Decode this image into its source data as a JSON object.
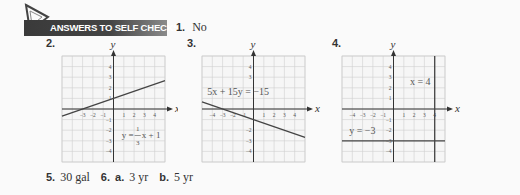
{
  "header": {
    "banner_title": "ANSWERS TO SELF CHECKS",
    "item1_number": "1.",
    "item1_answer": "No"
  },
  "labels": {
    "item2": "2.",
    "item3": "3.",
    "item4": "4."
  },
  "bottom": {
    "item5_number": "5.",
    "item5_answer": "30 gal",
    "item6_number": "6.",
    "item6a_label": "a.",
    "item6a_answer": "3 yr",
    "item6b_label": "b.",
    "item6b_answer": "5 yr"
  },
  "chart_data": [
    {
      "type": "line",
      "title": "2.",
      "xlabel": "x",
      "ylabel": "y",
      "xlim": [
        -5,
        5
      ],
      "ylim": [
        -5,
        5
      ],
      "xticks": [
        "-3",
        "-2",
        "-1",
        "1",
        "2",
        "3",
        "4"
      ],
      "yticks": [
        "4",
        "3",
        "2",
        "1",
        "-1",
        "-2",
        "-3",
        "-4"
      ],
      "grid": true,
      "series": [
        {
          "name": "y = 1/3 x + 1",
          "x": [
            -5,
            5
          ],
          "y": [
            -0.667,
            2.667
          ]
        }
      ],
      "annotation": {
        "text_main": "y =",
        "frac_num": "1",
        "frac_den": "3",
        "text_tail": "x + 1"
      }
    },
    {
      "type": "line",
      "title": "3.",
      "xlabel": "x",
      "ylabel": "y",
      "xlim": [
        -5,
        5
      ],
      "ylim": [
        -5,
        5
      ],
      "xticks": [
        "-4",
        "-3",
        "-2",
        "-1",
        "1",
        "2",
        "3",
        "4"
      ],
      "yticks": [
        "4",
        "3",
        "-2",
        "-3",
        "-4"
      ],
      "grid": true,
      "series": [
        {
          "name": "5x + 15y = -15",
          "x": [
            -5,
            5
          ],
          "y": [
            0.667,
            -2.667
          ]
        }
      ],
      "annotation": {
        "text": "5x + 15y = −15"
      }
    },
    {
      "type": "line",
      "title": "4.",
      "xlabel": "x",
      "ylabel": "y",
      "xlim": [
        -5,
        5
      ],
      "ylim": [
        -5,
        5
      ],
      "xticks": [
        "-4",
        "-3",
        "-2",
        "-1",
        "1",
        "2",
        "3",
        "4"
      ],
      "yticks": [
        "4",
        "3",
        "2",
        "1",
        "-1",
        "-2",
        "-3",
        "-4"
      ],
      "grid": true,
      "series": [
        {
          "name": "x = 4",
          "x": [
            4,
            4
          ],
          "y": [
            -5,
            5
          ]
        },
        {
          "name": "y = -3",
          "x": [
            -5,
            5
          ],
          "y": [
            -3,
            -3
          ]
        }
      ],
      "annotations": [
        {
          "text": "x = 4"
        },
        {
          "text": "y = −3"
        }
      ]
    }
  ]
}
